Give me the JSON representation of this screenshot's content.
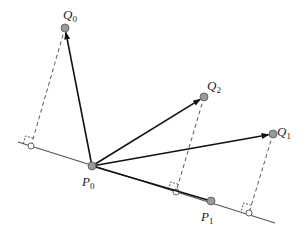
{
  "diagram": {
    "type": "vector-projection",
    "line": {
      "x1": 18,
      "y1": 142,
      "x2": 275,
      "y2": 223,
      "color": "#555555"
    },
    "origin": {
      "name": "P",
      "sub": "0",
      "x": 92,
      "y": 166,
      "label_x": 82,
      "label_y": 186
    },
    "line_point": {
      "name": "P",
      "sub": "1",
      "x": 211,
      "y": 201,
      "label_x": 201,
      "label_y": 221
    },
    "vectors": [
      {
        "to": "Q0",
        "x": 65,
        "y": 28
      },
      {
        "to": "Q2",
        "x": 204,
        "y": 97
      },
      {
        "to": "Q1",
        "x": 273,
        "y": 134
      }
    ],
    "points": [
      {
        "name": "Q",
        "sub": "0",
        "x": 65,
        "y": 28,
        "label_x": 63,
        "label_y": 19
      },
      {
        "name": "Q",
        "sub": "2",
        "x": 204,
        "y": 97,
        "label_x": 207,
        "label_y": 90
      },
      {
        "name": "Q",
        "sub": "1",
        "x": 273,
        "y": 134,
        "label_x": 277,
        "label_y": 136
      }
    ],
    "projections": [
      {
        "from": "Q0",
        "qx": 65,
        "qy": 28,
        "fx": 31,
        "fy": 146
      },
      {
        "from": "Q2",
        "qx": 204,
        "qy": 97,
        "fx": 176,
        "fy": 192
      },
      {
        "from": "Q1",
        "qx": 273,
        "qy": 134,
        "fx": 249,
        "fy": 213
      }
    ],
    "colors": {
      "vector": "#111111",
      "dashed": "#444444",
      "point_fill": "#999999",
      "point_stroke": "#555555",
      "foot_fill": "#ffffff"
    }
  }
}
